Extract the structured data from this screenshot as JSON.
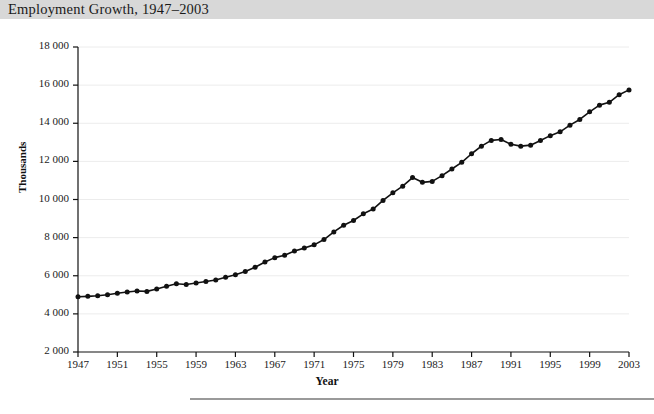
{
  "header": {
    "title": "Employment Growth, 1947–2003",
    "band_color": "#d8d8d8"
  },
  "chart_data": {
    "type": "line",
    "title": "Employment Growth, 1947–2003",
    "xlabel": "Year",
    "ylabel": "Thousands",
    "xlim": [
      1947,
      2003
    ],
    "ylim": [
      2000,
      18000
    ],
    "ytick_step": 2000,
    "xtick_step": 4,
    "grid": true,
    "grid_color": "#ececec",
    "legend": null,
    "line_color": "#111111",
    "marker": "circle",
    "marker_color": "#111111",
    "ytick_labels": [
      "2 000",
      "4 000",
      "6 000",
      "8 000",
      "10 000",
      "12 000",
      "14 000",
      "16 000",
      "18 000"
    ],
    "ytick_values": [
      2000,
      4000,
      6000,
      8000,
      10000,
      12000,
      14000,
      16000,
      18000
    ],
    "xtick_labels": [
      "1947",
      "1951",
      "1955",
      "1959",
      "1963",
      "1967",
      "1971",
      "1975",
      "1979",
      "1983",
      "1987",
      "1991",
      "1995",
      "1999",
      "2003"
    ],
    "xtick_values": [
      1947,
      1951,
      1955,
      1959,
      1963,
      1967,
      1971,
      1975,
      1979,
      1983,
      1987,
      1991,
      1995,
      1999,
      2003
    ],
    "x": [
      1947,
      1948,
      1949,
      1950,
      1951,
      1952,
      1953,
      1954,
      1955,
      1956,
      1957,
      1958,
      1959,
      1960,
      1961,
      1962,
      1963,
      1964,
      1965,
      1966,
      1967,
      1968,
      1969,
      1970,
      1971,
      1972,
      1973,
      1974,
      1975,
      1976,
      1977,
      1978,
      1979,
      1980,
      1981,
      1982,
      1983,
      1984,
      1985,
      1986,
      1987,
      1988,
      1989,
      1990,
      1991,
      1992,
      1993,
      1994,
      1995,
      1996,
      1997,
      1998,
      1999,
      2000,
      2001,
      2002,
      2003
    ],
    "values": [
      4900,
      4920,
      4950,
      5000,
      5080,
      5150,
      5200,
      5180,
      5300,
      5450,
      5580,
      5540,
      5620,
      5700,
      5780,
      5920,
      6050,
      6220,
      6450,
      6720,
      6950,
      7080,
      7300,
      7450,
      7620,
      7900,
      8300,
      8650,
      8900,
      9250,
      9500,
      9950,
      10350,
      10700,
      11150,
      10900,
      10950,
      11250,
      11600,
      11950,
      12400,
      12800,
      13100,
      13150,
      12900,
      12800,
      12850,
      13100,
      13350,
      13550,
      13900,
      14200,
      14600,
      14950,
      15100,
      15500,
      15750
    ]
  },
  "icons": {
    "none": ""
  }
}
